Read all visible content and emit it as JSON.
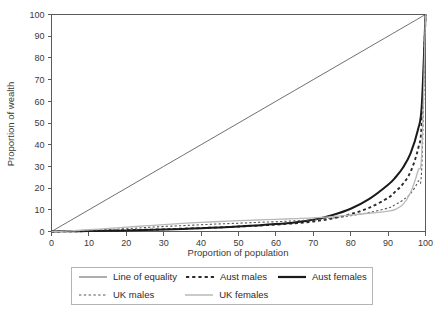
{
  "chart_data": {
    "type": "line",
    "title": "",
    "xlabel": "Proportion of population",
    "ylabel": "Proportion of wealth",
    "xlim": [
      0,
      100
    ],
    "ylim": [
      0,
      100
    ],
    "xticks": [
      0,
      10,
      20,
      30,
      40,
      50,
      60,
      70,
      80,
      90,
      100
    ],
    "yticks": [
      0,
      10,
      20,
      30,
      40,
      50,
      60,
      70,
      80,
      90,
      100
    ],
    "grid": false,
    "legend_position": "bottom",
    "x": [
      0,
      5,
      10,
      15,
      20,
      25,
      30,
      35,
      40,
      45,
      50,
      55,
      60,
      65,
      70,
      75,
      80,
      85,
      90,
      92,
      94,
      96,
      98,
      99,
      100
    ],
    "series": [
      {
        "name": "Line of equality",
        "style": "solid",
        "width": 0.8,
        "color": "#4a4a4a",
        "values": [
          0,
          5,
          10,
          15,
          20,
          25,
          30,
          35,
          40,
          45,
          50,
          55,
          60,
          65,
          70,
          75,
          80,
          85,
          90,
          92,
          94,
          96,
          98,
          99,
          100
        ]
      },
      {
        "name": "Aust males",
        "style": "dashed",
        "width": 1.9,
        "color": "#2a2a2a",
        "values": [
          0,
          0.1,
          0.2,
          0.4,
          0.6,
          0.8,
          1.0,
          1.3,
          1.6,
          1.9,
          2.3,
          2.7,
          3.2,
          3.8,
          4.6,
          6.0,
          8.0,
          11.0,
          15.5,
          18.5,
          22.0,
          27.5,
          38.0,
          50.0,
          100
        ]
      },
      {
        "name": "Aust females",
        "style": "solid",
        "width": 2.0,
        "color": "#1a1a1a",
        "values": [
          0,
          0.1,
          0.2,
          0.3,
          0.5,
          0.7,
          0.9,
          1.2,
          1.5,
          1.9,
          2.3,
          2.8,
          3.4,
          4.2,
          5.4,
          7.5,
          10.5,
          15.0,
          21.5,
          25.0,
          29.5,
          36.0,
          47.0,
          58.0,
          100
        ]
      },
      {
        "name": "UK males",
        "style": "dotted",
        "width": 1.1,
        "color": "#555555",
        "values": [
          0,
          0.2,
          0.5,
          0.9,
          1.3,
          1.8,
          2.3,
          2.7,
          3.1,
          3.5,
          3.8,
          4.2,
          4.5,
          4.9,
          5.4,
          6.2,
          7.3,
          8.8,
          10.8,
          12.5,
          14.5,
          17.5,
          23.0,
          29.5,
          100
        ]
      },
      {
        "name": "UK females",
        "style": "solid",
        "width": 1.3,
        "color": "#b9b9b9",
        "values": [
          0,
          0.3,
          0.8,
          1.4,
          2.0,
          2.6,
          3.2,
          3.7,
          4.2,
          4.6,
          5.0,
          5.3,
          5.6,
          5.9,
          6.3,
          6.9,
          7.6,
          8.4,
          9.4,
          10.2,
          12.5,
          18.0,
          28.0,
          36.5,
          100
        ]
      }
    ]
  },
  "legend": {
    "rows": [
      [
        {
          "label": "Line of equality",
          "swatch": "thin-solid-swatch"
        },
        {
          "label": "Aust males",
          "swatch": "thick-dashed-swatch"
        },
        {
          "label": "Aust females",
          "swatch": "thick-solid-swatch"
        }
      ],
      [
        {
          "label": "UK males",
          "swatch": "thin-dotted-swatch"
        },
        {
          "label": "UK females",
          "swatch": "gray-solid-swatch"
        }
      ]
    ]
  }
}
